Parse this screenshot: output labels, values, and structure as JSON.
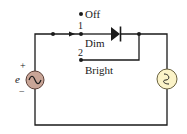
{
  "diagram": {
    "type": "circuit",
    "title": "",
    "source": {
      "symbol": "ac-voltage-source",
      "label": "e",
      "plus": "+",
      "minus": "−",
      "fill": "#c9a597"
    },
    "switch": {
      "positions": [
        {
          "id": "off",
          "label": "Off"
        },
        {
          "id": "1",
          "number": "1",
          "label": "Dim"
        },
        {
          "id": "2",
          "number": "2",
          "label": "Bright"
        }
      ]
    },
    "diode": {
      "symbol": "diode"
    },
    "lamp": {
      "symbol": "lamp",
      "fill": "#fbf3c8"
    },
    "colors": {
      "wire": "#1a1a1a",
      "source_fill": "#c9a597",
      "lamp_fill": "#fbf3c8"
    }
  }
}
